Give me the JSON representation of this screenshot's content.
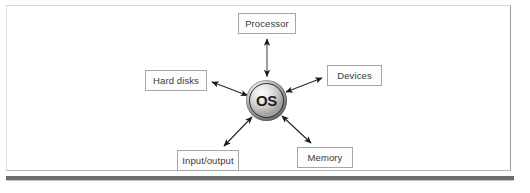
{
  "figure": {
    "center_node": {
      "label": "OS",
      "shape": "sphere",
      "fill_light": "#fafafa",
      "fill_dark": "#4e4e4e",
      "ring_color": "#2a2a2a"
    },
    "nodes": [
      {
        "id": "processor",
        "label": "Processor",
        "position": "top"
      },
      {
        "id": "hard-disks",
        "label": "Hard disks",
        "position": "left"
      },
      {
        "id": "devices",
        "label": "Devices",
        "position": "right"
      },
      {
        "id": "input-output",
        "label": "Input/output",
        "position": "bottom-left"
      },
      {
        "id": "memory",
        "label": "Memory",
        "position": "bottom-right"
      }
    ],
    "connections": [
      {
        "from": "OS",
        "to": "Processor",
        "style": "double-arrow"
      },
      {
        "from": "OS",
        "to": "Hard disks",
        "style": "double-arrow"
      },
      {
        "from": "OS",
        "to": "Devices",
        "style": "double-arrow"
      },
      {
        "from": "OS",
        "to": "Input/output",
        "style": "double-arrow"
      },
      {
        "from": "OS",
        "to": "Memory",
        "style": "double-arrow"
      }
    ],
    "colors": {
      "page_background": "#ffffff",
      "box_border": "#a6a6a6",
      "box_fill": "#fdfdfd",
      "text": "#3a3a3a",
      "arrow": "#1a1a1a",
      "frame_border": "#c9c9c9",
      "bottom_rule": "#6e6e6e"
    }
  }
}
